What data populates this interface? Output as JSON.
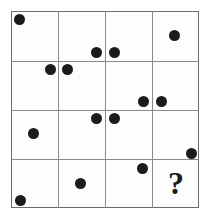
{
  "puzzle": {
    "type": "dot-pattern-matrix",
    "title": "",
    "canvas": {
      "width": 210,
      "height": 219,
      "background": "#ffffff"
    },
    "grid": {
      "rows": 4,
      "columns": 4,
      "left": 11,
      "top": 11,
      "right": 199,
      "bottom": 208,
      "cell_width": 47,
      "cell_height": 49.25,
      "border_color": "#6b6b6b",
      "line_color": "#8a8a8a",
      "border_width": 1,
      "cell_fill": "#fdfdfd",
      "v_lines": [
        58,
        105,
        152
      ],
      "h_lines": [
        61,
        110,
        159
      ]
    },
    "dot_style": {
      "color": "#1b1b1b",
      "radius": 5.5
    },
    "dots": [
      {
        "id": "dot-r1c1",
        "cell": "r1c1",
        "x": 19,
        "y": 19,
        "r": 5.5
      },
      {
        "id": "dot-r1c2",
        "cell": "r1c2",
        "x": 96,
        "y": 52,
        "r": 5.5
      },
      {
        "id": "dot-r1c3",
        "cell": "r1c3",
        "x": 114,
        "y": 52,
        "r": 5.5
      },
      {
        "id": "dot-r1c4",
        "cell": "r1c4",
        "x": 174,
        "y": 35,
        "r": 5.5
      },
      {
        "id": "dot-r2c1",
        "cell": "r2c1",
        "x": 50,
        "y": 69,
        "r": 5.5
      },
      {
        "id": "dot-r2c2",
        "cell": "r2c2",
        "x": 67,
        "y": 69,
        "r": 5.5
      },
      {
        "id": "dot-r2c3",
        "cell": "r2c3",
        "x": 143,
        "y": 101,
        "r": 5.5
      },
      {
        "id": "dot-r2c4",
        "cell": "r2c4",
        "x": 161,
        "y": 101,
        "r": 5.5
      },
      {
        "id": "dot-r3c1",
        "cell": "r3c1",
        "x": 33,
        "y": 133,
        "r": 5.5
      },
      {
        "id": "dot-r3c2",
        "cell": "r3c2",
        "x": 96,
        "y": 118,
        "r": 5.5
      },
      {
        "id": "dot-r3c3",
        "cell": "r3c3",
        "x": 114,
        "y": 118,
        "r": 5.5
      },
      {
        "id": "dot-r3c4",
        "cell": "r3c4",
        "x": 191,
        "y": 153,
        "r": 5.5
      },
      {
        "id": "dot-r4c3",
        "cell": "r4c3",
        "x": 142,
        "y": 168,
        "r": 5.5
      },
      {
        "id": "dot-r4c2",
        "cell": "r4c2",
        "x": 80,
        "y": 183,
        "r": 5.5
      },
      {
        "id": "dot-r4c1",
        "cell": "r4c1",
        "x": 20,
        "y": 200,
        "r": 5.5
      }
    ],
    "question_mark": {
      "label": "?",
      "cell": "r4c4",
      "x": 176,
      "y": 183,
      "font_size": 32,
      "color": "#1b1b1b"
    }
  }
}
